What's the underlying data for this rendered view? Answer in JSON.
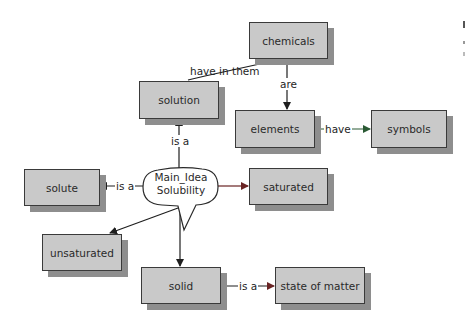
{
  "concept_map": {
    "main_idea": {
      "line1": "Main_Idea",
      "line2": "Solubility"
    },
    "nodes": {
      "chemicals": "chemicals",
      "solution": "solution",
      "elements": "elements",
      "symbols": "symbols",
      "solute": "solute",
      "saturated": "saturated",
      "unsaturated": "unsaturated",
      "solid": "solid",
      "state_of_matter": "state of matter"
    },
    "links": [
      {
        "from": "solution",
        "to": "chemicals",
        "label": "have in them"
      },
      {
        "from": "chemicals",
        "to": "elements",
        "label": "are"
      },
      {
        "from": "elements",
        "to": "symbols",
        "label": "have"
      },
      {
        "from": "Main_Idea Solubility",
        "to": "solution",
        "label": "is a"
      },
      {
        "from": "Main_Idea Solubility",
        "to": "solute",
        "label": "is a"
      },
      {
        "from": "Main_Idea Solubility",
        "to": "saturated",
        "label": ""
      },
      {
        "from": "Main_Idea Solubility",
        "to": "unsaturated",
        "label": ""
      },
      {
        "from": "Main_Idea Solubility",
        "to": "solid",
        "label": "is a"
      },
      {
        "from": "solid",
        "to": "state of matter",
        "label": "is a"
      }
    ],
    "colors": {
      "box_fill": "#c9c9c9",
      "box_shadow": "#8e8e8e",
      "line": "#1e1e1e",
      "saturated_link": "#7a2a2a",
      "have_link": "#2a6a3a"
    }
  }
}
